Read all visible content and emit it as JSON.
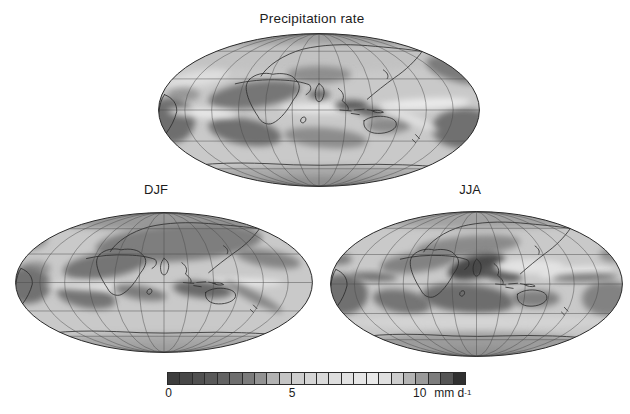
{
  "figure": {
    "title": "Precipitation rate",
    "background": "#ffffff",
    "projection": "Mollweide",
    "graticule_deg": 30,
    "line_color": "#4a4a4a",
    "coast_color": "#2a2a2a",
    "outline_color": "#2b2b2b"
  },
  "panels": [
    {
      "id": "annual",
      "label": "",
      "x": 158,
      "y": 33,
      "w": 322,
      "h": 154,
      "base": "#c9c9c9",
      "blobs": [
        [
          0.5,
          0.045,
          0.42,
          0.07,
          0,
          "#9e9e9e"
        ],
        [
          0.5,
          0.16,
          0.44,
          0.09,
          0,
          "#c2c2c2"
        ],
        [
          0.12,
          0.3,
          0.1,
          0.05,
          -10,
          "#dedede"
        ],
        [
          0.3,
          0.4,
          0.145,
          0.085,
          -8,
          "#767676"
        ],
        [
          0.5,
          0.27,
          0.1,
          0.055,
          0,
          "#8e8e8e"
        ],
        [
          0.93,
          0.24,
          0.1,
          0.075,
          15,
          "#7a7a7a"
        ],
        [
          0.08,
          0.4,
          0.05,
          0.045,
          0,
          "#989898"
        ],
        [
          0.035,
          0.57,
          0.08,
          0.15,
          0,
          "#6e6e6e"
        ],
        [
          0.27,
          0.64,
          0.115,
          0.085,
          10,
          "#6f6f6f"
        ],
        [
          0.52,
          0.68,
          0.13,
          0.065,
          5,
          "#8c8c8c"
        ],
        [
          0.95,
          0.62,
          0.1,
          0.13,
          0,
          "#6f6f6f"
        ],
        [
          0.715,
          0.6,
          0.07,
          0.05,
          0,
          "#8a8a8a"
        ],
        [
          0.14,
          0.52,
          0.11,
          0.03,
          3,
          "#e9e9e9"
        ],
        [
          0.52,
          0.49,
          0.14,
          0.035,
          0,
          "#e7e7e7"
        ],
        [
          0.83,
          0.46,
          0.14,
          0.035,
          -3,
          "#ebebeb"
        ],
        [
          0.78,
          0.55,
          0.1,
          0.03,
          25,
          "#dfdfdf"
        ],
        [
          0.6,
          0.47,
          0.05,
          0.035,
          0,
          "#5a5a5a"
        ],
        [
          0.655,
          0.51,
          0.045,
          0.03,
          10,
          "#5e5e5e"
        ],
        [
          0.5,
          0.4,
          0.035,
          0.03,
          0,
          "#686868"
        ],
        [
          0.5,
          0.92,
          0.36,
          0.06,
          0,
          "#a8a8a8"
        ],
        [
          0.5,
          1.02,
          0.3,
          0.09,
          0,
          "#8e8e8e"
        ]
      ]
    },
    {
      "id": "djf",
      "label": "DJF",
      "x": 15,
      "y": 212,
      "w": 298,
      "h": 141,
      "base": "#c9c9c9",
      "blobs": [
        [
          0.5,
          0.05,
          0.42,
          0.08,
          0,
          "#989898"
        ],
        [
          0.55,
          0.22,
          0.28,
          0.13,
          -4,
          "#7e7e7e"
        ],
        [
          0.3,
          0.38,
          0.14,
          0.09,
          -8,
          "#747474"
        ],
        [
          0.04,
          0.18,
          0.07,
          0.09,
          0,
          "#8c8c8c"
        ],
        [
          0.97,
          0.15,
          0.06,
          0.07,
          0,
          "#909090"
        ],
        [
          0.85,
          0.33,
          0.11,
          0.06,
          10,
          "#848484"
        ],
        [
          0.07,
          0.4,
          0.05,
          0.05,
          0,
          "#949494"
        ],
        [
          0.04,
          0.52,
          0.08,
          0.13,
          0,
          "#717171"
        ],
        [
          0.24,
          0.6,
          0.1,
          0.08,
          10,
          "#757575"
        ],
        [
          0.3,
          0.53,
          0.2,
          0.03,
          2,
          "#e3e3e3"
        ],
        [
          0.75,
          0.5,
          0.15,
          0.03,
          0,
          "#e6e6e6"
        ],
        [
          0.42,
          0.57,
          0.09,
          0.05,
          10,
          "#7c7c7c"
        ],
        [
          0.63,
          0.55,
          0.1,
          0.06,
          5,
          "#696969"
        ],
        [
          0.8,
          0.6,
          0.11,
          0.035,
          28,
          "#848484"
        ],
        [
          0.5,
          0.92,
          0.36,
          0.06,
          0,
          "#a8a8a8"
        ],
        [
          0.5,
          1.03,
          0.3,
          0.09,
          0,
          "#9a9a9a"
        ]
      ]
    },
    {
      "id": "jja",
      "label": "JJA",
      "x": 330,
      "y": 211,
      "w": 293,
      "h": 146,
      "base": "#c9c9c9",
      "blobs": [
        [
          0.5,
          0.05,
          0.42,
          0.07,
          0,
          "#a2a2a2"
        ],
        [
          0.47,
          0.24,
          0.18,
          0.07,
          -5,
          "#8a8a8a"
        ],
        [
          0.3,
          0.35,
          0.13,
          0.07,
          -8,
          "#828282"
        ],
        [
          0.5,
          0.38,
          0.1,
          0.08,
          -15,
          "#484848"
        ],
        [
          0.585,
          0.43,
          0.07,
          0.05,
          10,
          "#585858"
        ],
        [
          0.68,
          0.38,
          0.12,
          0.05,
          0,
          "#e3e3e3"
        ],
        [
          0.84,
          0.42,
          0.13,
          0.04,
          -3,
          "#e6e6e6"
        ],
        [
          0.87,
          0.455,
          0.11,
          0.025,
          -2,
          "#6e6e6e"
        ],
        [
          0.15,
          0.45,
          0.08,
          0.028,
          3,
          "#6a6a6a"
        ],
        [
          0.04,
          0.57,
          0.09,
          0.14,
          0,
          "#6f6f6f"
        ],
        [
          0.245,
          0.62,
          0.1,
          0.08,
          10,
          "#757575"
        ],
        [
          0.47,
          0.6,
          0.16,
          0.1,
          5,
          "#6d6d6d"
        ],
        [
          0.7,
          0.6,
          0.085,
          0.06,
          0,
          "#808080"
        ],
        [
          0.95,
          0.6,
          0.09,
          0.12,
          0,
          "#828282"
        ],
        [
          0.97,
          0.3,
          0.05,
          0.05,
          0,
          "#8e8e8e"
        ],
        [
          0.03,
          0.33,
          0.045,
          0.04,
          0,
          "#7e7e7e"
        ],
        [
          0.5,
          0.76,
          0.45,
          0.045,
          0,
          "#d4d4d4"
        ],
        [
          0.5,
          0.9,
          0.37,
          0.07,
          0,
          "#9c9c9c"
        ],
        [
          0.5,
          1.02,
          0.3,
          0.09,
          0,
          "#8e8e8e"
        ]
      ]
    }
  ],
  "colorbar": {
    "min": 0,
    "max": 12,
    "ticks": [
      {
        "value": "0",
        "frac": 0.005
      },
      {
        "value": "5",
        "frac": 0.418
      },
      {
        "value": "10",
        "frac": 0.845
      }
    ],
    "unit": "mm d",
    "unit_sup": "-1",
    "cells": [
      "#3d3d3d",
      "#474747",
      "#505050",
      "#595959",
      "#636363",
      "#6e6e6e",
      "#7b7b7b",
      "#929292",
      "#b2b2b2",
      "#c4c4c4",
      "#cecece",
      "#d5d5d5",
      "#dadada",
      "#dedede",
      "#e2e2e2",
      "#e6e6e6",
      "#e9e9e9",
      "#e0e0e0",
      "#cdcdcd",
      "#b4b4b4",
      "#9a9a9a",
      "#7c7c7c",
      "#555555",
      "#303030"
    ]
  }
}
